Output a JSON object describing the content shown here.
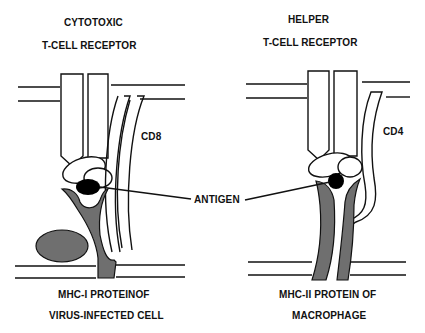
{
  "left_panel": {
    "title_line1": "CYTOTOXIC",
    "title_line2": "T-CELL RECEPTOR",
    "coreceptor_label": "CD8",
    "mhc_label_line1": "MHC-I PROTEINOF",
    "mhc_label_line2": "VIRUS-INFECTED CELL"
  },
  "right_panel": {
    "title_line1": "HELPER",
    "title_line2": "T-CELL RECEPTOR",
    "coreceptor_label": "CD4",
    "mhc_label_line1": "MHC-II PROTEIN OF",
    "mhc_label_line2": "MACROPHAGE"
  },
  "center": {
    "antigen_label": "ANTIGEN"
  },
  "colors": {
    "mhc_fill": "#6f6f6f",
    "antigen_fill": "#000000",
    "line": "#111111",
    "background": "#ffffff"
  }
}
